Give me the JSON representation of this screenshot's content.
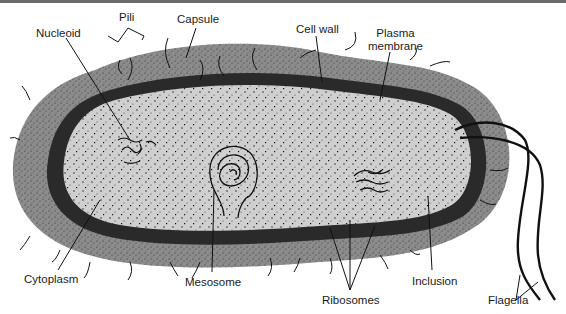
{
  "diagram": {
    "labels": {
      "pili": "Pili",
      "capsule": "Capsule",
      "nucleoid": "Nucleoid",
      "cell_wall": "Cell wall",
      "plasma_membrane_line1": "Plasma",
      "plasma_membrane_line2": "membrane",
      "cytoplasm": "Cytoplasm",
      "mesosome": "Mesosome",
      "ribosomes": "Ribosomes",
      "inclusion": "Inclusion",
      "flagella": "Flagella"
    },
    "colors": {
      "capsule": "#8c8c8c",
      "cell_wall": "#2a2a2a",
      "cytoplasm": "#cfcfcf",
      "ink": "#111111",
      "border": "#6a6a6a"
    }
  }
}
